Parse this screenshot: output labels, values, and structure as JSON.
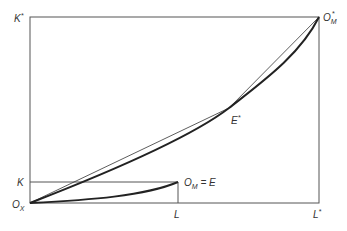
{
  "diagram": {
    "type": "edgeworth-box",
    "colors": {
      "line": "#555555",
      "curve": "#222222",
      "background": "#ffffff"
    },
    "labels": {
      "k_star": {
        "main": "K",
        "sup": "*"
      },
      "k": {
        "main": "K"
      },
      "l": {
        "main": "L"
      },
      "l_star": {
        "main": "L",
        "sup": "*"
      },
      "origin_x": {
        "main": "O",
        "sub": "X"
      },
      "origin_m_star": {
        "main": "O",
        "sub": "M",
        "sup": "*"
      },
      "origin_m_eq_e": {
        "main": "O",
        "sub": "M",
        "rest": " = E"
      },
      "e_star": {
        "main": "E",
        "sup": "*"
      }
    },
    "points": {
      "Ox": [
        30,
        203
      ],
      "OM_star": [
        319,
        17
      ],
      "OM_E": [
        178,
        182
      ],
      "E_star": [
        229,
        108
      ],
      "K_level_y": 182,
      "L_level_x": 178
    }
  }
}
